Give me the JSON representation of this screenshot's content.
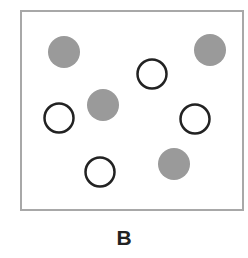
{
  "panel_label": "B",
  "colors": {
    "filled": "#9a9a9a",
    "outline": "#222222",
    "border": "#a8a8a8"
  },
  "circles": [
    {
      "type": "filled",
      "cx": 64,
      "cy": 52,
      "r": 16
    },
    {
      "type": "filled",
      "cx": 210,
      "cy": 50,
      "r": 16
    },
    {
      "type": "open",
      "cx": 152,
      "cy": 74,
      "r": 16
    },
    {
      "type": "filled",
      "cx": 103,
      "cy": 105,
      "r": 16
    },
    {
      "type": "open",
      "cx": 59,
      "cy": 118,
      "r": 16
    },
    {
      "type": "open",
      "cx": 195,
      "cy": 119,
      "r": 16
    },
    {
      "type": "open",
      "cx": 100,
      "cy": 172,
      "r": 16
    },
    {
      "type": "filled",
      "cx": 174,
      "cy": 164,
      "r": 16
    }
  ],
  "counts": {
    "filled": 4,
    "open": 4
  }
}
